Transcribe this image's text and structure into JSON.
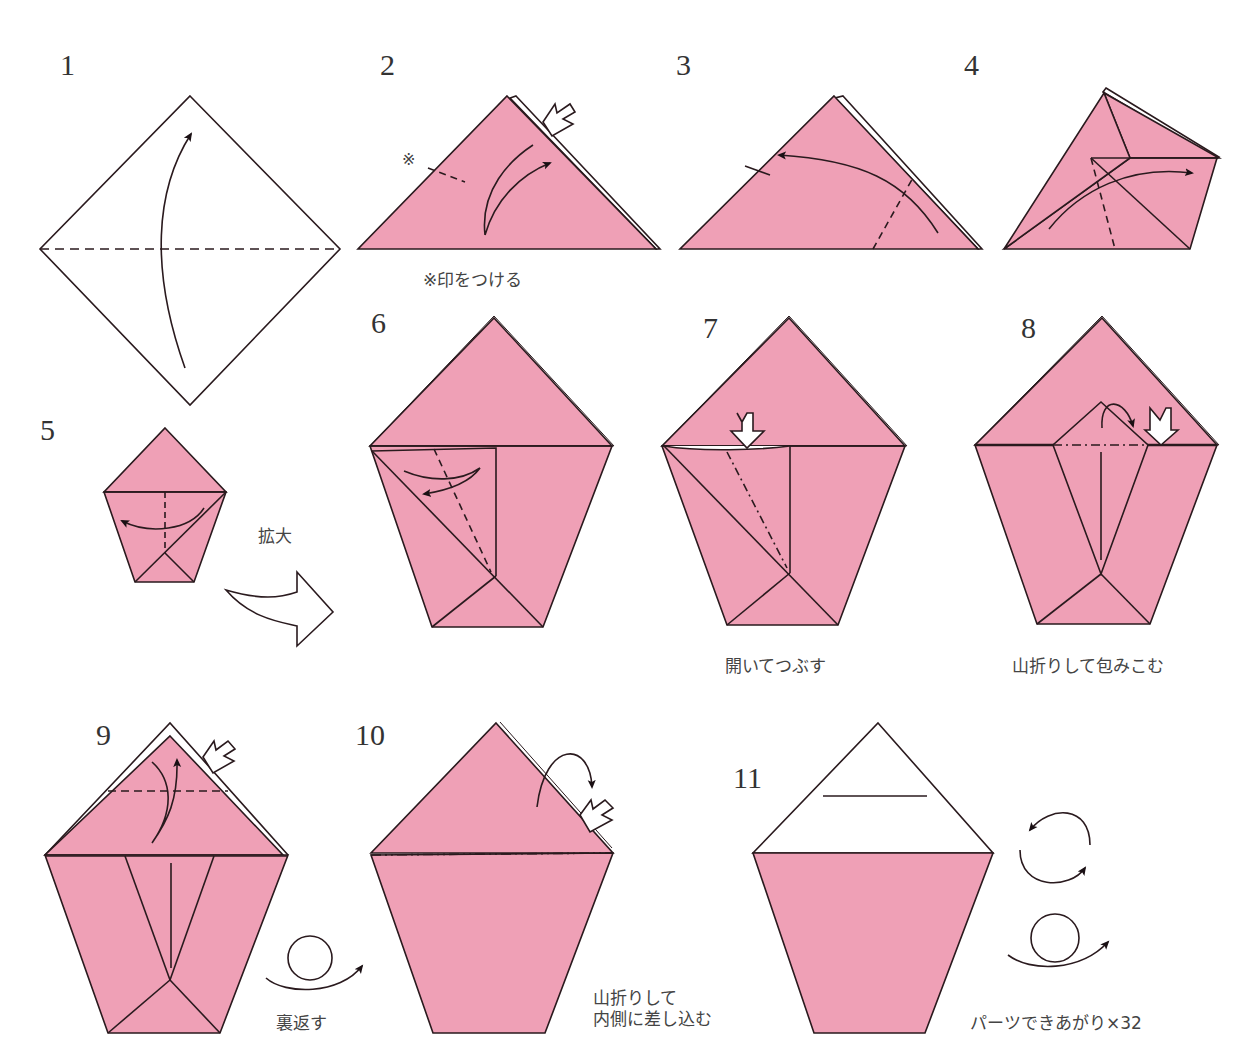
{
  "colors": {
    "paper_pink": "#EFA0B6",
    "line": "#2a1a1e",
    "white": "#ffffff"
  },
  "steps": [
    {
      "number": "1",
      "caption": ""
    },
    {
      "number": "2",
      "caption": "※印をつける",
      "mark": "※"
    },
    {
      "number": "3",
      "caption": ""
    },
    {
      "number": "4",
      "caption": ""
    },
    {
      "number": "5",
      "caption": "",
      "zoom_label": "拡大"
    },
    {
      "number": "6",
      "caption": ""
    },
    {
      "number": "7",
      "caption": "開いてつぶす"
    },
    {
      "number": "8",
      "caption": "山折りして包みこむ"
    },
    {
      "number": "9",
      "caption": "",
      "flip_label": "裏返す"
    },
    {
      "number": "10",
      "caption": "山折りして\n内側に差し込む"
    },
    {
      "number": "11",
      "caption": "パーツできあがり×32"
    }
  ],
  "icons": {
    "fold_arrow": "curved-arrow",
    "push_arrow": "hollow-push-arrow",
    "enlarge_arrow": "hollow-curved-big-arrow",
    "flip_over": "turn-over-symbol",
    "rotate": "rotate-symbol"
  }
}
